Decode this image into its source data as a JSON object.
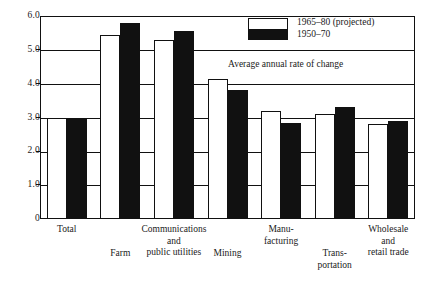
{
  "chart_data": {
    "type": "bar",
    "title": "",
    "subtitle": "",
    "annotation": "Average annual rate of change",
    "xlabel": "",
    "ylabel": "",
    "ylim": [
      0,
      6.0
    ],
    "yticks": [
      "0",
      "1.0",
      "2.0",
      "3.0",
      "4.0",
      "5.0",
      "6.0"
    ],
    "ytick_values": [
      0,
      1.0,
      2.0,
      3.0,
      4.0,
      5.0,
      6.0
    ],
    "grid": true,
    "legend_position": "top-right",
    "categories": [
      "Total",
      "Farm",
      "Communications\nand\npublic utilities",
      "Mining",
      "Manu-\nfacturing",
      "Trans-\nportation",
      "Wholesale\nand\nretail trade"
    ],
    "series": [
      {
        "name": "1965–80 (projected)",
        "color": "#ffffff",
        "values": [
          3.0,
          5.45,
          5.3,
          4.15,
          3.2,
          3.1,
          2.8
        ]
      },
      {
        "name": "1950–70",
        "color": "#111111",
        "values": [
          3.0,
          5.8,
          5.55,
          3.8,
          2.85,
          3.3,
          2.9
        ]
      }
    ]
  },
  "legend": {
    "entries": [
      "1965–80 (projected)",
      "1950–70"
    ]
  },
  "labels": {
    "row1": [
      "Total",
      "Farm",
      "Mining",
      "Trans-\nportation"
    ],
    "row2": [
      "Communications\nand\npublic utilities",
      "Manu-\nfacturing",
      "Wholesale\nand\nretail trade"
    ]
  }
}
